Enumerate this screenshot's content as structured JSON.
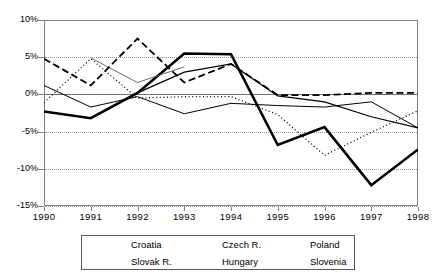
{
  "chart_data": {
    "type": "line",
    "title": "",
    "xlabel": "",
    "ylabel": "",
    "categories": [
      "1990",
      "1991",
      "1992",
      "1993",
      "1994",
      "1995",
      "1996",
      "1997",
      "1998"
    ],
    "x": [
      1990,
      1991,
      1992,
      1993,
      1994,
      1995,
      1996,
      1997,
      1998
    ],
    "ylim": [
      -15,
      10
    ],
    "ytick_labels": [
      "10%",
      "5%",
      "0%",
      "-5%",
      "-10%",
      "-15%"
    ],
    "ytick_values": [
      10,
      5,
      0,
      -5,
      -10,
      -15
    ],
    "grid": true,
    "legend_position": "bottom",
    "series": [
      {
        "name": "Croatia",
        "style": "thick-solid",
        "color": "#000000",
        "width": 2.6,
        "dash": "none",
        "x": [
          1990,
          1991,
          1992,
          1993,
          1994,
          1995,
          1996,
          1997,
          1998
        ],
        "values": [
          -2.3,
          -3.2,
          0.2,
          5.5,
          5.4,
          -6.8,
          -4.4,
          -12.2,
          -7.4
        ]
      },
      {
        "name": "Czech R.",
        "style": "dotted",
        "color": "#000000",
        "width": 1.3,
        "dash": "1,2.6",
        "x": [
          1990,
          1991,
          1992,
          1993,
          1994,
          1995,
          1996,
          1997,
          1998
        ],
        "values": [
          -1.1,
          4.8,
          -0.5,
          -0.3,
          -0.3,
          -2.7,
          -8.2,
          -5.1,
          -2.2
        ]
      },
      {
        "name": "Poland",
        "style": "solid",
        "color": "#000000",
        "width": 1.2,
        "dash": "none",
        "x": [
          1990,
          1991,
          1992,
          1993,
          1994,
          1995,
          1996,
          1997,
          1998
        ],
        "values": [
          -2.3,
          -3.2,
          0.2,
          3.0,
          4.1,
          -0.2,
          -1.0,
          -3.0,
          -4.5
        ]
      },
      {
        "name": "Slovak R.",
        "style": "thin-light",
        "color": "#5b5b5b",
        "width": 0.9,
        "dash": "none",
        "x": [
          1991,
          1992,
          1993
        ],
        "values": [
          4.9,
          1.6,
          3.7
        ]
      },
      {
        "name": "Hungary",
        "style": "thin-solid",
        "color": "#000000",
        "width": 1.0,
        "dash": "none",
        "x": [
          1990,
          1991,
          1992,
          1993,
          1994,
          1995,
          1996,
          1997,
          1998
        ],
        "values": [
          1.2,
          -1.7,
          -0.3,
          -2.6,
          -1.2,
          -1.5,
          -1.7,
          -1.0,
          -4.5
        ]
      },
      {
        "name": "Slovenia",
        "style": "dashed",
        "color": "#000000",
        "width": 1.8,
        "dash": "7,3.5",
        "x": [
          1990,
          1991,
          1992,
          1993,
          1994,
          1995,
          1996,
          1997,
          1998
        ],
        "values": [
          4.8,
          1.2,
          7.5,
          1.6,
          4.1,
          -0.1,
          -0.1,
          0.2,
          0.2
        ]
      }
    ]
  },
  "legend": {
    "rows": [
      [
        {
          "label": "Croatia",
          "series": "Croatia"
        },
        {
          "label": "Czech R.",
          "series": "Czech R."
        },
        {
          "label": "Poland",
          "series": "Poland"
        }
      ],
      [
        {
          "label": "Slovak R.",
          "series": "Slovak R."
        },
        {
          "label": "Hungary",
          "series": "Hungary"
        },
        {
          "label": "Slovenia",
          "series": "Slovenia"
        }
      ]
    ]
  }
}
